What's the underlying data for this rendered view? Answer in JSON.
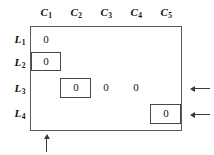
{
  "figure": {
    "type": "matrix-diagram",
    "background_color": "#ffffff",
    "line_color": "#5a5a5a",
    "text_color": "#111111"
  },
  "columns": [
    {
      "base": "C",
      "sub": "1",
      "label": "C1"
    },
    {
      "base": "C",
      "sub": "2",
      "label": "C2"
    },
    {
      "base": "C",
      "sub": "3",
      "label": "C3"
    },
    {
      "base": "C",
      "sub": "4",
      "label": "C4"
    },
    {
      "base": "C",
      "sub": "5",
      "label": "C5"
    }
  ],
  "rows": [
    {
      "base": "L",
      "sub": "1",
      "label": "L1"
    },
    {
      "base": "L",
      "sub": "2",
      "label": "L2"
    },
    {
      "base": "L",
      "sub": "3",
      "label": "L3"
    },
    {
      "base": "L",
      "sub": "4",
      "label": "L4"
    }
  ],
  "entries": [
    {
      "row": "L1",
      "col": "C1",
      "value": "0",
      "boxed": false
    },
    {
      "row": "L2",
      "col": "C1",
      "value": "0",
      "boxed": true
    },
    {
      "row": "L3",
      "col": "C2",
      "value": "0",
      "boxed": true
    },
    {
      "row": "L3",
      "col": "C3",
      "value": "0",
      "boxed": false
    },
    {
      "row": "L3",
      "col": "C4",
      "value": "0",
      "boxed": false
    },
    {
      "row": "L4",
      "col": "C5",
      "value": "0",
      "boxed": true
    }
  ],
  "values": {
    "v_l1c1": "0",
    "v_l2c1": "0",
    "v_l3c2": "0",
    "v_l3c3": "0",
    "v_l3c4": "0",
    "v_l4c5": "0"
  },
  "markers": [
    {
      "name": "row-arrow-l3",
      "direction": "left",
      "target_row": "L3"
    },
    {
      "name": "row-arrow-l4",
      "direction": "left",
      "target_row": "L4"
    },
    {
      "name": "column-arrow-c1",
      "direction": "up",
      "target_col": "C1"
    }
  ]
}
